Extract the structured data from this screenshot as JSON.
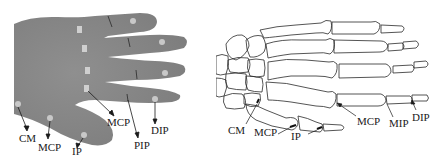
{
  "figure": {
    "panels": [
      {
        "id": "photo",
        "description": "Photograph of a hand with markers on joints",
        "labels": {
          "cm": "CM",
          "mcp_thumb": "MCP",
          "ip": "IP",
          "mcp_finger": "MCP",
          "pip": "PIP",
          "dip": "DIP"
        }
      },
      {
        "id": "skeleton",
        "description": "Line drawing of hand skeleton with joints labelled",
        "labels": {
          "cm": "CM",
          "mcp_thumb": "MCP",
          "ip": "IP",
          "mcp_finger": "MCP",
          "mip": "MIP",
          "dip": "DIP"
        }
      }
    ],
    "colors": {
      "skin": "#8a8a8a",
      "marker": "#c8c8c8",
      "bone_stroke": "#2a2a2a",
      "label": "#1a1a1a"
    }
  }
}
